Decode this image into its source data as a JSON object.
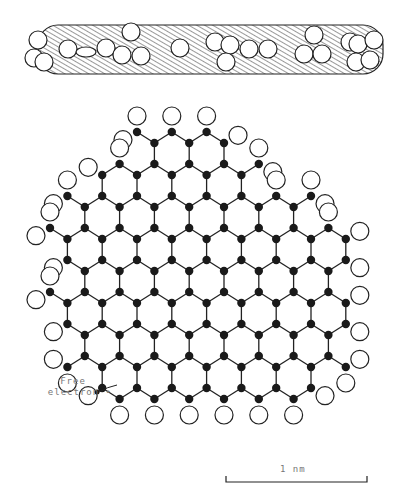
{
  "labels": {
    "free_electron_line1": "Free",
    "free_electron_line2": "electron",
    "scale": "1 nm"
  },
  "colors": {
    "stroke": "#222222",
    "carbon": "#1a1a1a",
    "hydrogen_fill": "#ffffff",
    "hatch": "#333333"
  },
  "soot_particle": {
    "x": 38,
    "y": 25,
    "width": 345,
    "height": 49,
    "corner_radius": 20,
    "circles": [
      [
        38,
        40
      ],
      [
        34,
        58
      ],
      [
        44,
        62
      ],
      [
        68,
        49
      ],
      [
        106,
        48
      ],
      [
        131,
        32
      ],
      [
        122,
        55
      ],
      [
        141,
        56
      ],
      [
        180,
        48
      ],
      [
        215,
        42
      ],
      [
        230,
        45
      ],
      [
        226,
        62
      ],
      [
        249,
        49
      ],
      [
        268,
        49
      ],
      [
        314,
        35
      ],
      [
        304,
        54
      ],
      [
        322,
        54
      ],
      [
        350,
        42
      ],
      [
        358,
        44
      ],
      [
        356,
        62
      ],
      [
        374,
        40
      ],
      [
        370,
        60
      ]
    ],
    "ellipse": [
      86,
      52,
      10,
      5
    ],
    "circle_radius": 9
  },
  "lattice": {
    "x0": 50,
    "dx": 17.4,
    "y0": 132,
    "row_pitch": 32,
    "zig": 11,
    "atom_radius": 4.2,
    "h_radius": 9,
    "h_dist": 16,
    "rows": [
      {
        "r": 0,
        "from": 5,
        "to": 10
      },
      {
        "r": 1,
        "from": 3,
        "to": 12
      },
      {
        "r": 2,
        "from": 1,
        "to": 15
      },
      {
        "r": 3,
        "from": 0,
        "to": 17
      },
      {
        "r": 4,
        "from": 1,
        "to": 17
      },
      {
        "r": 5,
        "from": 0,
        "to": 17
      },
      {
        "r": 6,
        "from": 1,
        "to": 17
      },
      {
        "r": 7,
        "from": 1,
        "to": 17
      },
      {
        "r": 8,
        "from": 3,
        "to": 15
      }
    ],
    "free_electron": {
      "x": 97,
      "y": 392
    }
  },
  "scale_bar": {
    "x1": 226,
    "x2": 367,
    "y": 482,
    "tick": 6
  }
}
